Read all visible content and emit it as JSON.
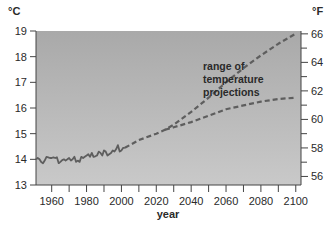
{
  "chart_data": {
    "type": "line",
    "title": "",
    "xlabel": "year",
    "ylabel": "°C",
    "ylabel_right": "°F",
    "xlim": [
      1951,
      2103
    ],
    "ylim": [
      13,
      19
    ],
    "ylim_right": [
      55.4,
      66.2
    ],
    "grid": false,
    "x_ticks": [
      1960,
      1980,
      2000,
      2020,
      2040,
      2060,
      2080,
      2100
    ],
    "x_minor_ticks": [
      1970,
      1990,
      2010,
      2030,
      2050,
      2070,
      2090
    ],
    "x_tick_labels": [
      "1960",
      "1980",
      "2000",
      "2020",
      "2040",
      "2060",
      "2080",
      "2100"
    ],
    "y_ticks": [
      13,
      14,
      15,
      16,
      17,
      18,
      19
    ],
    "y_tick_labels": [
      "13",
      "14",
      "15",
      "16",
      "17",
      "18",
      "19"
    ],
    "y_right_ticks": [
      56,
      58,
      60,
      62,
      64,
      66
    ],
    "y_right_minor_ticks": [
      57,
      59,
      61,
      63,
      65
    ],
    "y_right_tick_labels": [
      "56",
      "58",
      "60",
      "62",
      "64",
      "66"
    ],
    "annotation": [
      "range of",
      "temperature",
      "projections"
    ],
    "series": [
      {
        "name": "observed",
        "style": "solid",
        "x": [
          1951,
          1952,
          1953,
          1954,
          1955,
          1956,
          1957,
          1958,
          1959,
          1960,
          1961,
          1962,
          1963,
          1964,
          1965,
          1966,
          1967,
          1968,
          1969,
          1970,
          1971,
          1972,
          1973,
          1974,
          1975,
          1976,
          1977,
          1978,
          1979,
          1980,
          1981,
          1982,
          1983,
          1984,
          1985,
          1986,
          1987,
          1988,
          1989,
          1990,
          1991,
          1992,
          1993,
          1994,
          1995,
          1996,
          1997,
          1998,
          1999,
          2000,
          2001,
          2002
        ],
        "values": [
          14.0,
          14.05,
          14.0,
          13.9,
          13.85,
          13.95,
          14.1,
          14.08,
          14.05,
          14.05,
          14.08,
          14.05,
          14.08,
          13.85,
          13.9,
          13.97,
          14.0,
          13.95,
          14.0,
          14.05,
          13.95,
          14.0,
          14.1,
          13.9,
          13.95,
          13.9,
          14.1,
          14.05,
          14.1,
          14.15,
          14.2,
          14.1,
          14.25,
          14.1,
          14.12,
          14.15,
          14.3,
          14.25,
          14.15,
          14.35,
          14.3,
          14.15,
          14.2,
          14.25,
          14.35,
          14.3,
          14.4,
          14.55,
          14.3,
          14.35,
          14.45,
          14.45
        ]
      },
      {
        "name": "projection-high",
        "style": "dashed",
        "x": [
          2002,
          2010,
          2020,
          2025,
          2030,
          2040,
          2050,
          2060,
          2070,
          2080,
          2090,
          2100
        ],
        "values": [
          14.45,
          14.75,
          15.0,
          15.15,
          15.35,
          15.85,
          16.4,
          17.0,
          17.55,
          18.05,
          18.5,
          18.9
        ]
      },
      {
        "name": "projection-low",
        "style": "dashed",
        "x": [
          2025,
          2030,
          2040,
          2050,
          2060,
          2070,
          2080,
          2090,
          2100
        ],
        "values": [
          15.15,
          15.25,
          15.45,
          15.7,
          15.95,
          16.1,
          16.25,
          16.35,
          16.4
        ]
      }
    ],
    "colors": {
      "plot_bg_top": "#a9a9a9",
      "plot_bg_bottom": "#c9c9c9",
      "line": "#5e5e5e",
      "axis": "#444444",
      "text": "#2a2a2a"
    }
  }
}
